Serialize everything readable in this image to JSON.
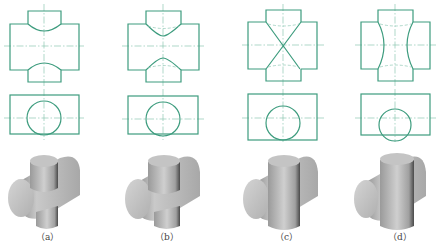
{
  "figure": {
    "colors": {
      "line": "#3d9c7e",
      "centerline": "#8cc7b3",
      "solid": "#b4b4b4"
    },
    "panels": [
      {
        "label": "（a）",
        "case": "vertical cylinder smaller than horizontal"
      },
      {
        "label": "（b）",
        "case": "vertical cylinder slightly smaller"
      },
      {
        "label": "（c）",
        "case": "equal diameters"
      },
      {
        "label": "（d）",
        "case": "vertical cylinder larger"
      }
    ]
  }
}
